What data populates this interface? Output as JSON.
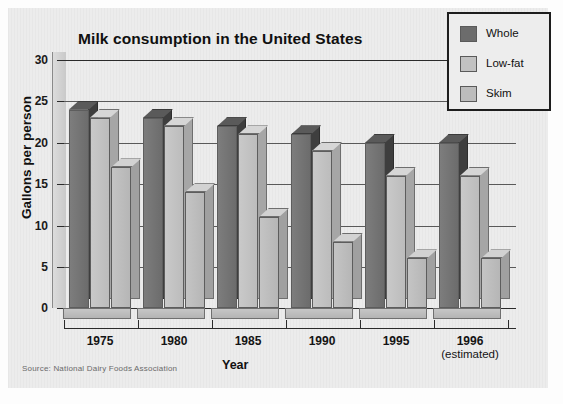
{
  "chart_data": {
    "type": "bar",
    "title": "Milk consumption in the United States",
    "xlabel": "Year",
    "ylabel": "Gallons per person",
    "categories": [
      "1975",
      "1980",
      "1985",
      "1990",
      "1995",
      "1996"
    ],
    "category_sublabels": [
      "",
      "",
      "",
      "",
      "",
      "(estimated)"
    ],
    "series": [
      {
        "name": "Whole",
        "color": "#6c6c6c",
        "values": [
          24,
          23,
          22,
          21,
          20,
          20
        ]
      },
      {
        "name": "Low-fat",
        "color": "#c2c2c2",
        "values": [
          23,
          22,
          21,
          19,
          16,
          16
        ]
      },
      {
        "name": "Skim",
        "color": "#bcbcbc",
        "values": [
          17,
          14,
          11,
          8,
          6,
          6
        ]
      }
    ],
    "ylim": [
      0,
      30
    ],
    "yticks": [
      0,
      5,
      10,
      15,
      20,
      25,
      30
    ],
    "ytick_labels": [
      "0",
      "5",
      "10",
      "15",
      "20",
      "25",
      "30"
    ],
    "grid": true,
    "legend_position": "top-right",
    "style": "3d-column",
    "source": "Source: National Dairy Foods Association"
  },
  "chart": {
    "title": "Milk consumption in the United States",
    "y_axis_title": "Gallons per person",
    "x_axis_title": "Year",
    "source_note": "Source: National Dairy Foods Association"
  },
  "legend": {
    "items": [
      {
        "label": "Whole"
      },
      {
        "label": "Low-fat"
      },
      {
        "label": "Skim"
      }
    ]
  }
}
